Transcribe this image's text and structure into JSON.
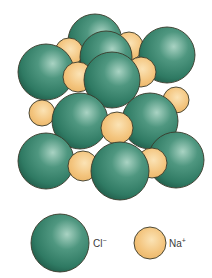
{
  "diagram": {
    "colors": {
      "cl_fill": "#2f7a63",
      "cl_highlight": "#a9d3c3",
      "cl_dark": "#1d5443",
      "na_fill": "#f3c47d",
      "na_highlight": "#fbe3b5",
      "outline": "#3a3a2a",
      "background": "#ffffff"
    },
    "spheres": [
      {
        "type": "Cl",
        "cx": 95,
        "cy": 41,
        "r": 27
      },
      {
        "type": "Na",
        "cx": 69,
        "cy": 52,
        "r": 14
      },
      {
        "type": "Na",
        "cx": 129,
        "cy": 46,
        "r": 14
      },
      {
        "type": "Cl",
        "cx": 106,
        "cy": 57,
        "r": 26
      },
      {
        "type": "Cl",
        "cx": 46,
        "cy": 72,
        "r": 28
      },
      {
        "type": "Cl",
        "cx": 167,
        "cy": 55,
        "r": 28
      },
      {
        "type": "Na",
        "cx": 78,
        "cy": 77,
        "r": 15
      },
      {
        "type": "Na",
        "cx": 141,
        "cy": 72,
        "r": 15
      },
      {
        "type": "Na",
        "cx": 176,
        "cy": 100,
        "r": 13
      },
      {
        "type": "Na",
        "cx": 42,
        "cy": 113,
        "r": 13
      },
      {
        "type": "Cl",
        "cx": 112,
        "cy": 80,
        "r": 28
      },
      {
        "type": "Cl",
        "cx": 80,
        "cy": 121,
        "r": 28
      },
      {
        "type": "Cl",
        "cx": 150,
        "cy": 121,
        "r": 28
      },
      {
        "type": "Na",
        "cx": 117,
        "cy": 128,
        "r": 16
      },
      {
        "type": "Cl",
        "cx": 46,
        "cy": 161,
        "r": 28
      },
      {
        "type": "Cl",
        "cx": 176,
        "cy": 160,
        "r": 28
      },
      {
        "type": "Na",
        "cx": 83,
        "cy": 166,
        "r": 15
      },
      {
        "type": "Na",
        "cx": 152,
        "cy": 163,
        "r": 15
      },
      {
        "type": "Cl",
        "cx": 120,
        "cy": 171,
        "r": 29
      }
    ],
    "legend": [
      {
        "type": "Cl",
        "cx": 60,
        "cy": 243,
        "r": 29,
        "label": "Cl",
        "charge": "−",
        "label_x": 93,
        "label_y": 237
      },
      {
        "type": "Na",
        "cx": 150,
        "cy": 243,
        "r": 16,
        "label": "Na",
        "charge": "+",
        "label_x": 169,
        "label_y": 237
      }
    ]
  }
}
